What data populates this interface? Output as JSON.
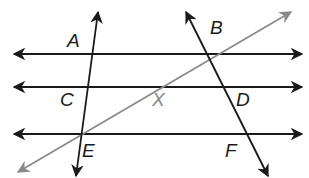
{
  "diagram": {
    "colors": {
      "line": "#1a1a1a",
      "gray_line": "#8a8a8a",
      "background": "#ffffff"
    },
    "labels": {
      "A": "A",
      "B": "B",
      "C": "C",
      "D": "D",
      "E": "E",
      "F": "F",
      "X": "X"
    }
  }
}
